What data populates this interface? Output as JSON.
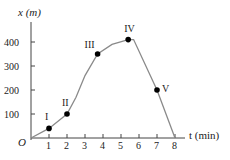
{
  "chart_data": {
    "type": "line",
    "title": "",
    "xlabel": "t (min)",
    "ylabel": "x (m)",
    "origin_label": "O",
    "x_ticks": [
      1,
      2,
      3,
      4,
      5,
      6,
      7,
      8
    ],
    "y_ticks": [
      100,
      200,
      300,
      400
    ],
    "xlim": [
      0,
      8.5
    ],
    "ylim": [
      0,
      450
    ],
    "grid": false,
    "curve": {
      "x": [
        0,
        1,
        2,
        2.5,
        3,
        3.7,
        4.5,
        5.4,
        5.7,
        7,
        8
      ],
      "y": [
        0,
        40,
        100,
        170,
        260,
        350,
        390,
        410,
        410,
        200,
        0
      ]
    },
    "points": [
      {
        "label": "I",
        "t": 1,
        "x": 40
      },
      {
        "label": "II",
        "t": 2,
        "x": 100
      },
      {
        "label": "III",
        "t": 3.7,
        "x": 350
      },
      {
        "label": "IV",
        "t": 5.4,
        "x": 410
      },
      {
        "label": "V",
        "t": 7,
        "x": 200
      }
    ]
  }
}
